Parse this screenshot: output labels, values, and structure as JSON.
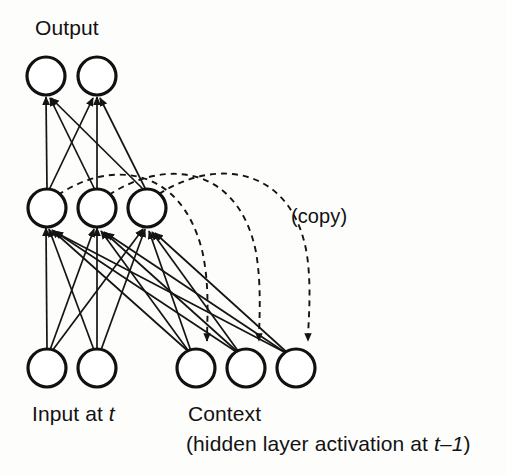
{
  "figure": {
    "background_color": "#fdfdfc",
    "ink_color": "#141414"
  },
  "labels": {
    "output": "Output",
    "copy": "(copy)",
    "input_prefix": "Input at ",
    "input_time": "t",
    "context": "Context",
    "context_sub_open": "(hidden layer activation at ",
    "context_sub_time": "t–1",
    "context_sub_close": ")"
  },
  "layers": [
    {
      "name": "output",
      "label": "Output",
      "count": 2,
      "radius": 19,
      "cy": 76,
      "node_x": [
        46,
        97
      ]
    },
    {
      "name": "hidden",
      "label": "Hidden",
      "count": 3,
      "radius": 19,
      "cy": 208,
      "node_x": [
        47,
        97,
        147
      ]
    },
    {
      "name": "input",
      "label": "Input at t",
      "count": 2,
      "radius": 19,
      "cy": 368,
      "node_x": [
        47,
        97
      ]
    },
    {
      "name": "context",
      "label": "Context",
      "count": 3,
      "radius": 19,
      "cy": 368,
      "node_x": [
        196,
        246,
        296
      ]
    }
  ],
  "connections": {
    "hidden_to_output": {
      "style": "solid",
      "arrow": "at-target",
      "pairs": [
        [
          0,
          0
        ],
        [
          0,
          1
        ],
        [
          1,
          0
        ],
        [
          1,
          1
        ],
        [
          2,
          0
        ],
        [
          2,
          1
        ]
      ]
    },
    "bottom_to_hidden": {
      "style": "solid",
      "arrow": "at-target",
      "source_layers": [
        "input",
        "context"
      ],
      "count": 15
    },
    "copy_links": {
      "style": "dashed",
      "arrow": "at-target",
      "label": "(copy)",
      "pairs": [
        [
          0,
          0
        ],
        [
          1,
          1
        ],
        [
          2,
          2
        ]
      ]
    }
  }
}
